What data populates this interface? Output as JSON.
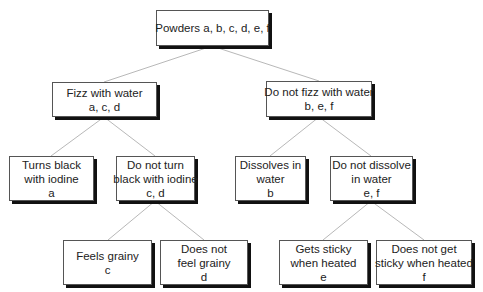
{
  "diagram": {
    "type": "decision-tree",
    "nodes": {
      "root": {
        "lines": [
          "Powders a, b, c, d, e, f"
        ]
      },
      "fizz": {
        "lines": [
          "Fizz with water",
          "a, c, d"
        ]
      },
      "nofizz": {
        "lines": [
          "Do not fizz with water",
          "b, e, f"
        ]
      },
      "black": {
        "lines": [
          "Turns black",
          "with iodine",
          "a"
        ]
      },
      "noblack": {
        "lines": [
          "Do not turn",
          "black with iodine",
          "c, d"
        ]
      },
      "dissolve": {
        "lines": [
          "Dissolves in",
          "water",
          "b"
        ]
      },
      "nodissolve": {
        "lines": [
          "Do not dissolve",
          "in water",
          "e, f"
        ]
      },
      "grainy": {
        "lines": [
          "Feels grainy",
          "c"
        ]
      },
      "nograiny": {
        "lines": [
          "Does not",
          "feel grainy",
          "d"
        ]
      },
      "sticky": {
        "lines": [
          "Gets sticky",
          "when heated",
          "e"
        ]
      },
      "nosticky": {
        "lines": [
          "Does not get",
          "sticky when heated",
          "f"
        ]
      }
    },
    "edges": [
      [
        "root",
        "fizz"
      ],
      [
        "root",
        "nofizz"
      ],
      [
        "fizz",
        "black"
      ],
      [
        "fizz",
        "noblack"
      ],
      [
        "nofizz",
        "dissolve"
      ],
      [
        "nofizz",
        "nodissolve"
      ],
      [
        "noblack",
        "grainy"
      ],
      [
        "noblack",
        "nograiny"
      ],
      [
        "nodissolve",
        "sticky"
      ],
      [
        "nodissolve",
        "nosticky"
      ]
    ]
  }
}
